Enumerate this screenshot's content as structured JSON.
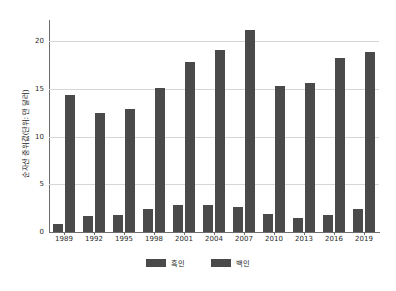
{
  "chart_data": {
    "type": "bar",
    "title": "",
    "subtitle": "",
    "xlabel": "",
    "ylabel": "순자산 중위값(단위: 만 달러)",
    "categories": [
      "1989",
      "1992",
      "1995",
      "1998",
      "2001",
      "2004",
      "2007",
      "2010",
      "2013",
      "2016",
      "2019"
    ],
    "series": [
      {
        "name": "흑인",
        "color": "#4a4a4a",
        "values": [
          0.8,
          1.7,
          1.8,
          2.4,
          2.8,
          2.8,
          2.6,
          1.9,
          1.5,
          1.8,
          2.4
        ]
      },
      {
        "name": "백인",
        "color": "#4a4a4a",
        "values": [
          14.3,
          12.5,
          12.9,
          15.1,
          17.8,
          19.1,
          21.2,
          15.3,
          15.6,
          18.2,
          18.9
        ]
      }
    ],
    "ylim": [
      0,
      22.2
    ],
    "yticks": [
      0,
      5,
      10,
      15,
      20
    ],
    "ytick_labels": [
      "0",
      "5",
      "10",
      "15",
      "20"
    ],
    "grid": "horizontal",
    "legend_position": "bottom"
  },
  "colors": {
    "bar": "#4a4a4a",
    "gridline": "#d6d6d6",
    "axis": "#6e6e6e",
    "background": "#ffffff",
    "text": "#2a2a2a"
  }
}
